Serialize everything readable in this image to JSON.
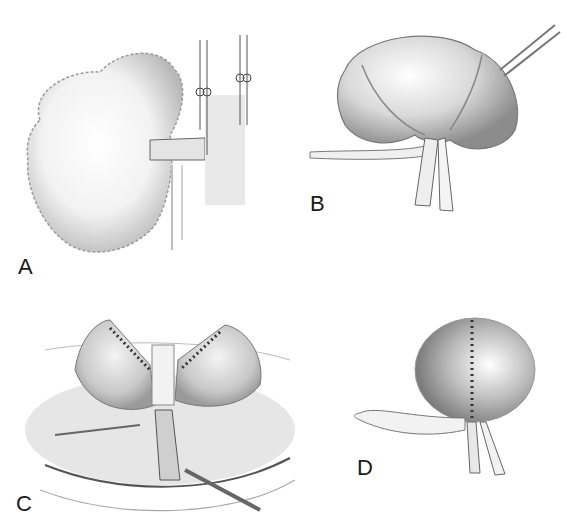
{
  "figure": {
    "panels": [
      {
        "id": "A",
        "label": "A",
        "subject": "organ-with-vessel-and-retraction-sutures"
      },
      {
        "id": "B",
        "label": "B",
        "subject": "tied-lobed-organ-with-tube"
      },
      {
        "id": "C",
        "label": "C",
        "subject": "opened-organ-with-suture-lines-in-field"
      },
      {
        "id": "D",
        "label": "D",
        "subject": "sutured-spherical-organ-with-ties"
      }
    ],
    "colors": {
      "background": "#ffffff",
      "ink": "#1a1a1a",
      "shade": "#9a9a9a",
      "light": "#d6d6d6"
    }
  }
}
